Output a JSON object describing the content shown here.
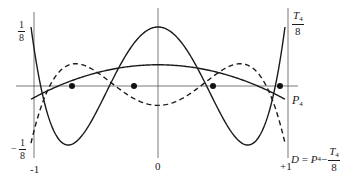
{
  "figure": {
    "axes": {
      "x_ticks": [
        {
          "label": "-1",
          "value": -1
        },
        {
          "label": "0",
          "value": 0
        },
        {
          "label": "+1",
          "value": 1
        }
      ],
      "y_ticks": [
        {
          "label_num": "1",
          "label_den": "8",
          "value": 0.125
        },
        {
          "label_sign": "−",
          "label_num": "1",
          "label_den": "8",
          "value": -0.125
        }
      ]
    },
    "curves": [
      {
        "name": "T4/8",
        "style": "solid",
        "label_num": "T",
        "label_sub": "4",
        "label_den": "8"
      },
      {
        "name": "P4",
        "style": "solid",
        "label_main": "P",
        "label_sub": "4"
      },
      {
        "name": "D",
        "style": "dashed",
        "label_prefix": "D = P",
        "label_sub": "4",
        "label_minus": " − ",
        "label_num": "T",
        "label_num_sub": "4",
        "label_den": "8"
      }
    ],
    "markers": {
      "type": "filled-dot",
      "x_positions": [
        -0.7,
        -0.2,
        0.44,
        0.97
      ],
      "note": "intersection points on horizontal axis"
    }
  }
}
